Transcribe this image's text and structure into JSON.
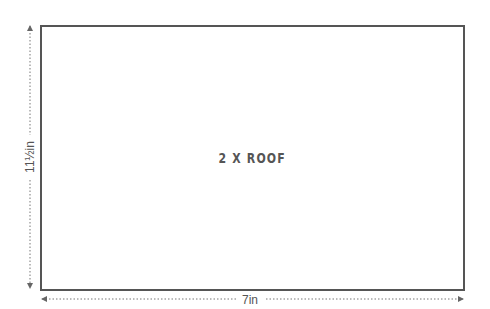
{
  "diagram": {
    "panel": {
      "label": "2 X ROOF",
      "border_color": "#555555"
    },
    "dimensions": {
      "height_label": "11½in",
      "width_label": "7in",
      "line_color": "#777777"
    }
  }
}
